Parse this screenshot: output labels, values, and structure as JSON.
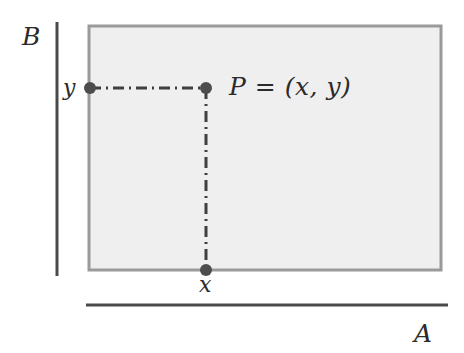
{
  "figure": {
    "type": "cartesian-product-diagram",
    "background_color": "#ffffff"
  },
  "axes": {
    "vertical": {
      "label": "B",
      "color": "#4a4a4a",
      "x": 57,
      "y_start": 22,
      "y_end": 276,
      "width": 3
    },
    "horizontal": {
      "label": "A",
      "color": "#4a4a4a",
      "y": 305,
      "x_start": 86,
      "x_end": 448,
      "width": 3
    }
  },
  "product_region": {
    "name": "A x B rectangle",
    "x": 89,
    "y": 26,
    "width": 352,
    "height": 244,
    "fill_color": "#efefef",
    "border_color": "#9a9a9a",
    "border_width": 3
  },
  "point": {
    "label": "P = (x, y)",
    "x": 206,
    "y": 88,
    "radius": 6,
    "color": "#4d4d4d"
  },
  "projections": {
    "vertical_coordinate": {
      "label": "y",
      "x": 90,
      "y": 88,
      "radius": 6,
      "color": "#4d4d4d"
    },
    "horizontal_coordinate": {
      "label": "x",
      "x": 206,
      "y": 270,
      "radius": 6,
      "color": "#4d4d4d"
    }
  },
  "connector_lines": {
    "style": "dash-dot",
    "color": "#3f3f3f",
    "width": 3,
    "dash_pattern": "11 5 2 5",
    "horizontal": {
      "x1": 90,
      "y1": 88,
      "x2": 206,
      "y2": 88
    },
    "vertical": {
      "x1": 206,
      "y1": 88,
      "x2": 206,
      "y2": 270
    }
  }
}
